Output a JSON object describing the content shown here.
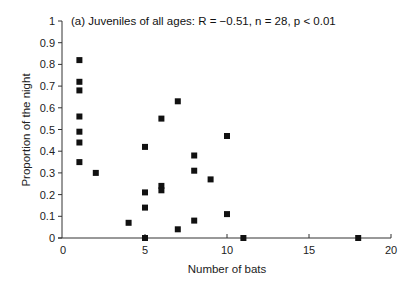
{
  "chart_data": {
    "type": "scatter",
    "title": "(a) Juveniles of all ages: R = −0.51, n = 28, p < 0.01",
    "xlabel": "Number of bats",
    "ylabel": "Proportion of the night",
    "xlim": [
      0,
      20
    ],
    "ylim": [
      0,
      1
    ],
    "x_ticks": [
      0,
      5,
      10,
      15,
      20
    ],
    "x_tick_labels": [
      "0",
      "5",
      "10",
      "15",
      "20"
    ],
    "y_ticks": [
      0,
      0.1,
      0.2,
      0.3,
      0.4,
      0.5,
      0.6,
      0.7,
      0.8,
      0.9,
      1
    ],
    "y_tick_labels": [
      "0",
      "0.1",
      "0.2",
      "0.3",
      "0.4",
      "0.5",
      "0.6",
      "0.7",
      "0.8",
      "0.9",
      "1"
    ],
    "grid": false,
    "legend": null,
    "marker": "filled-square",
    "marker_color": "#111111",
    "stats": {
      "R": -0.51,
      "n": 28,
      "p": "< 0.01"
    },
    "points": [
      {
        "x": 1,
        "y": 0.82
      },
      {
        "x": 1,
        "y": 0.72
      },
      {
        "x": 1,
        "y": 0.68
      },
      {
        "x": 1,
        "y": 0.56
      },
      {
        "x": 1,
        "y": 0.49
      },
      {
        "x": 1,
        "y": 0.44
      },
      {
        "x": 1,
        "y": 0.35
      },
      {
        "x": 2,
        "y": 0.3
      },
      {
        "x": 4,
        "y": 0.07
      },
      {
        "x": 5,
        "y": 0.42
      },
      {
        "x": 5,
        "y": 0.21
      },
      {
        "x": 5,
        "y": 0.14
      },
      {
        "x": 5,
        "y": 0.0
      },
      {
        "x": 6,
        "y": 0.55
      },
      {
        "x": 6,
        "y": 0.24
      },
      {
        "x": 6,
        "y": 0.22
      },
      {
        "x": 7,
        "y": 0.63
      },
      {
        "x": 7,
        "y": 0.04
      },
      {
        "x": 8,
        "y": 0.38
      },
      {
        "x": 8,
        "y": 0.31
      },
      {
        "x": 8,
        "y": 0.08
      },
      {
        "x": 9,
        "y": 0.27
      },
      {
        "x": 10,
        "y": 0.47
      },
      {
        "x": 10,
        "y": 0.11
      },
      {
        "x": 11,
        "y": 0.0
      },
      {
        "x": 18,
        "y": 0.0
      }
    ]
  }
}
